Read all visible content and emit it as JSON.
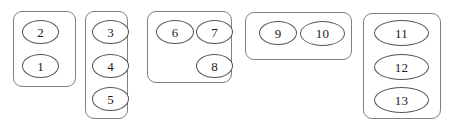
{
  "diagram": {
    "background_color": "#ffffff",
    "box_stroke_color": "#808080",
    "node_stroke_color": "#555555",
    "text_color": "#1a1a1a",
    "groups": [
      {
        "name": "group-1",
        "x": 13,
        "y": 11,
        "w": 63,
        "h": 76,
        "nodes": [
          {
            "label": "2",
            "x": 22,
            "y": 20,
            "w": 37,
            "h": 24
          },
          {
            "label": "1",
            "x": 22,
            "y": 54,
            "w": 37,
            "h": 24
          }
        ]
      },
      {
        "name": "group-2",
        "x": 85,
        "y": 11,
        "w": 43,
        "h": 108,
        "nodes": [
          {
            "label": "3",
            "x": 92,
            "y": 20,
            "w": 37,
            "h": 24
          },
          {
            "label": "4",
            "x": 92,
            "y": 54,
            "w": 37,
            "h": 24
          },
          {
            "label": "5",
            "x": 92,
            "y": 87,
            "w": 37,
            "h": 24
          }
        ]
      },
      {
        "name": "group-3",
        "x": 147,
        "y": 11,
        "w": 85,
        "h": 72,
        "nodes": [
          {
            "label": "6",
            "x": 156,
            "y": 20,
            "w": 38,
            "h": 24
          },
          {
            "label": "7",
            "x": 196,
            "y": 20,
            "w": 37,
            "h": 24
          },
          {
            "label": "8",
            "x": 196,
            "y": 54,
            "w": 37,
            "h": 24
          }
        ]
      },
      {
        "name": "group-4",
        "x": 245,
        "y": 12,
        "w": 107,
        "h": 48,
        "nodes": [
          {
            "label": "9",
            "x": 259,
            "y": 21,
            "w": 38,
            "h": 24
          },
          {
            "label": "10",
            "x": 300,
            "y": 21,
            "w": 45,
            "h": 25
          }
        ]
      },
      {
        "name": "group-5",
        "x": 363,
        "y": 13,
        "w": 78,
        "h": 106,
        "nodes": [
          {
            "label": "11",
            "x": 374,
            "y": 20,
            "w": 55,
            "h": 26
          },
          {
            "label": "12",
            "x": 374,
            "y": 54,
            "w": 55,
            "h": 26
          },
          {
            "label": "13",
            "x": 374,
            "y": 87,
            "w": 55,
            "h": 26
          }
        ]
      }
    ]
  }
}
